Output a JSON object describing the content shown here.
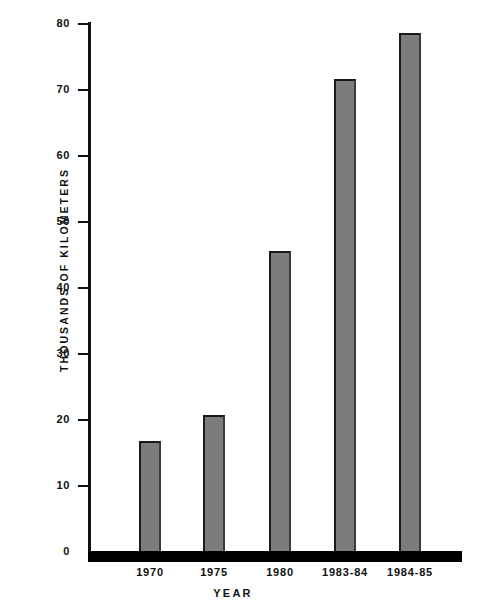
{
  "chart_data": {
    "type": "bar",
    "title": "",
    "xlabel": "YEAR",
    "ylabel": "THOUSANDS OF KILOMETERS",
    "categories": [
      "1970",
      "1975",
      "1980",
      "1983-84",
      "1984-85"
    ],
    "values": [
      16.8,
      20.7,
      45.5,
      71.5,
      78.5
    ],
    "ylim": [
      0,
      80
    ],
    "yticks": [
      0,
      10,
      20,
      30,
      40,
      50,
      60,
      70,
      80
    ],
    "ytick_labels": [
      "0",
      "10",
      "20",
      "30",
      "40",
      "50",
      "60",
      "70",
      "80"
    ],
    "grid": false,
    "legend": null,
    "bar_color": "#7c7c7c",
    "axis_color": "#111111",
    "background": "#ffffff"
  }
}
